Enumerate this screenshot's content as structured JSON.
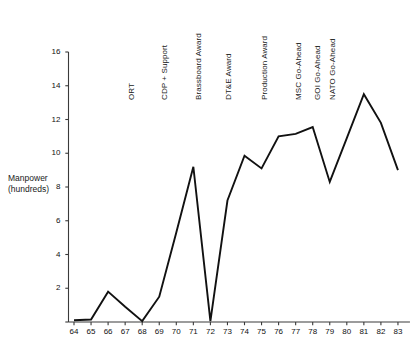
{
  "chart_data": {
    "type": "line",
    "title": "",
    "subtitle": "",
    "xlabel": "",
    "ylabel": "Manpower (hundreds)",
    "ylabel_line1": "Manpower",
    "ylabel_line2": "(hundreds)",
    "grid": false,
    "legend": "none",
    "line_color": "#111111",
    "axis_color": "#3a3a3a",
    "xlim": [
      63.2,
      83.6
    ],
    "ylim": [
      0,
      16
    ],
    "y_ticks": [
      0,
      2,
      4,
      6,
      8,
      10,
      12,
      14,
      16
    ],
    "y_tick_labels": [
      "",
      "2",
      "4",
      "6",
      "8",
      "10",
      "12",
      "14",
      "16"
    ],
    "x": [
      64,
      65,
      66,
      67,
      68,
      69,
      70,
      71,
      72,
      73,
      74,
      75,
      76,
      77,
      78,
      79,
      80,
      81,
      82,
      83
    ],
    "x_tick_labels": [
      "64",
      "65",
      "66",
      "67",
      "68",
      "69",
      "70",
      "71",
      "72",
      "73",
      "74",
      "75",
      "76",
      "77",
      "78",
      "79",
      "80",
      "81",
      "82",
      "83"
    ],
    "values": [
      0.1,
      0.15,
      1.8,
      0.9,
      0.05,
      1.5,
      5.3,
      9.2,
      0.05,
      7.2,
      9.85,
      9.1,
      11.0,
      11.15,
      11.55,
      8.3,
      10.9,
      13.5,
      11.8,
      9.0
    ],
    "series": [
      {
        "name": "Manpower",
        "values": [
          0.1,
          0.15,
          1.8,
          0.9,
          0.05,
          1.5,
          5.3,
          9.2,
          0.05,
          7.2,
          9.85,
          9.1,
          11.0,
          11.15,
          11.55,
          8.3,
          10.9,
          13.5,
          11.8,
          9.0
        ]
      }
    ],
    "annotations": [
      {
        "label": "ORT",
        "x": 67.0
      },
      {
        "label": "CDP + Support",
        "x": 68.9
      },
      {
        "label": "Brassboard Award",
        "x": 70.9
      },
      {
        "label": "DT&E Award",
        "x": 72.7
      },
      {
        "label": "Production Award",
        "x": 74.8
      },
      {
        "label": "MSC Go-Ahead",
        "x": 76.8
      },
      {
        "label": "GOI Go-Ahead",
        "x": 77.9
      },
      {
        "label": "NATO Go-Ahead",
        "x": 78.8
      }
    ]
  }
}
